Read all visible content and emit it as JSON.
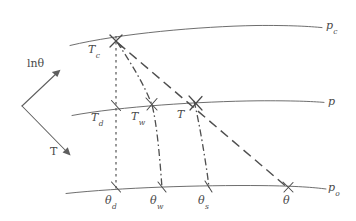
{
  "figure": {
    "background_color": "#ffffff",
    "line_color": "#5a5a5a",
    "text_color": "#4a4a4a"
  },
  "axes": {
    "vertical": {
      "label": "ln",
      "symbol": "θ",
      "name": "ln-theta-axis",
      "direction": "up-right"
    },
    "horizontal": {
      "label": "T",
      "name": "temperature-axis",
      "direction": "down-right"
    }
  },
  "isobars": [
    {
      "id": "pc",
      "label": "p",
      "sub": "c",
      "name": "isobar-pc",
      "description": "condensation level pressure"
    },
    {
      "id": "p",
      "label": "p",
      "sub": "",
      "name": "isobar-p",
      "description": "ambient pressure level"
    },
    {
      "id": "po",
      "label": "p",
      "sub": "o",
      "name": "isobar-po",
      "description": "reference pressure level"
    }
  ],
  "points": {
    "Tc": {
      "label": "T",
      "sub": "c",
      "x": 116,
      "y": 41,
      "on": "pc",
      "name": "point-Tc"
    },
    "Td": {
      "label": "T",
      "sub": "d",
      "x": 116,
      "y": 108,
      "on": "p",
      "name": "point-Td"
    },
    "Tw": {
      "label": "T",
      "sub": "w",
      "x": 152,
      "y": 105,
      "on": "p",
      "name": "point-Tw"
    },
    "T": {
      "label": "T",
      "sub": "",
      "x": 196,
      "y": 103,
      "on": "p",
      "name": "point-T"
    },
    "theta_d": {
      "label": "θ",
      "sub": "d",
      "x": 116,
      "y": 189,
      "on": "po",
      "name": "point-theta-d"
    },
    "theta_w": {
      "label": "θ",
      "sub": "w",
      "x": 162,
      "y": 189,
      "on": "po",
      "name": "point-theta-w"
    },
    "theta_s": {
      "label": "θ",
      "sub": "s",
      "x": 209,
      "y": 189,
      "on": "po",
      "name": "point-theta-s"
    },
    "theta": {
      "label": "θ",
      "sub": "",
      "x": 288,
      "y": 189,
      "on": "po",
      "name": "point-theta"
    }
  },
  "processes": [
    {
      "id": "dry-adiabat-dewpoint",
      "style": "dotted",
      "from": "Tc",
      "to": "theta_d",
      "name": "line-dry-adiabat-dewpoint"
    },
    {
      "id": "saturated-adiabat-wetbulb",
      "style": "dash-dot",
      "from": "Tc",
      "to": "theta_w",
      "name": "line-saturated-adiabat-wetbulb"
    },
    {
      "id": "saturated-adiabat-T",
      "style": "dash-dot",
      "from": "T",
      "to": "theta_s",
      "name": "line-saturated-adiabat-T"
    },
    {
      "id": "dry-adiabat-T",
      "style": "dashed",
      "from": "Tc",
      "to": "theta",
      "name": "line-dry-adiabat-T"
    }
  ]
}
